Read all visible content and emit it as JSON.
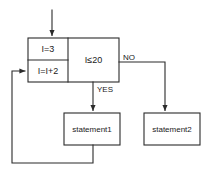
{
  "diagram": {
    "stroke_color": "#2b2b2b",
    "fill_color": "#ffffff",
    "text_color": "#1a1a1a",
    "nodes": {
      "initialize": {
        "text": "I=3",
        "shape": "process-cell"
      },
      "increment": {
        "text": "I=I+2",
        "shape": "process-cell"
      },
      "condition": {
        "text": "I≤20",
        "shape": "decision-cell"
      },
      "statement1": {
        "text": "statement1",
        "shape": "process"
      },
      "statement2": {
        "text": "statement2",
        "shape": "process"
      }
    },
    "edges": {
      "entry": {
        "label": "",
        "from": "start",
        "to": "initialize"
      },
      "no_branch": {
        "label": "NO",
        "from": "condition",
        "to": "statement2"
      },
      "yes_branch": {
        "label": "YES",
        "from": "condition",
        "to": "statement1"
      },
      "loop_back": {
        "label": "",
        "from": "statement1",
        "to": "increment"
      }
    }
  }
}
